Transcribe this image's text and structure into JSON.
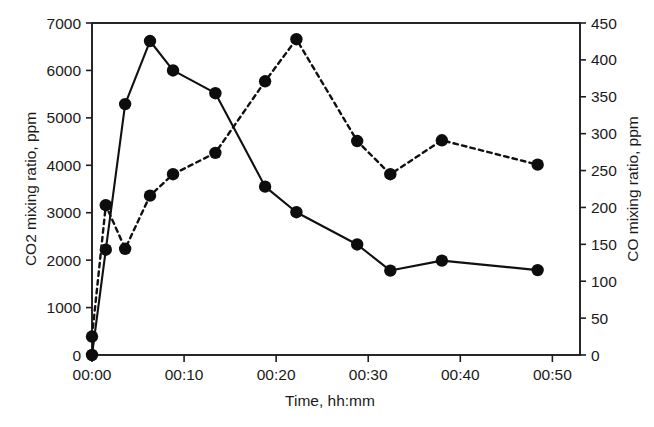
{
  "chart_data": {
    "type": "line",
    "title": "",
    "xlabel": "Time, hh:mm",
    "ylabel": "CO2 mixing ratio, ppm",
    "y2label": "CO mixing ratio, ppm",
    "grid": false,
    "legend": "none",
    "xlim": [
      0,
      53
    ],
    "xticks": [
      0,
      10,
      20,
      30,
      40,
      50
    ],
    "xticklabels": [
      "00:00",
      "00:10",
      "00:20",
      "00:30",
      "00:40",
      "00:50"
    ],
    "ylim": [
      0,
      7000
    ],
    "yticks": [
      0,
      1000,
      2000,
      3000,
      4000,
      5000,
      6000,
      7000
    ],
    "yticklabels": [
      "0",
      "1000",
      "2000",
      "3000",
      "4000",
      "5000",
      "6000",
      "7000"
    ],
    "y2lim": [
      0,
      450
    ],
    "y2ticks": [
      0,
      50,
      100,
      150,
      200,
      250,
      300,
      350,
      400,
      450
    ],
    "y2ticklabels": [
      "0",
      "50",
      "100",
      "150",
      "200",
      "250",
      "300",
      "350",
      "400",
      "450"
    ],
    "series": [
      {
        "name": "CO2 mixing ratio, ppm",
        "axis": "left",
        "style": "solid",
        "marker": "filled-circle",
        "color": "#101010",
        "x": [
          0.0,
          1.5,
          3.6,
          6.3,
          8.8,
          13.4,
          18.8,
          22.2,
          28.8,
          32.4,
          38.0,
          48.4
        ],
        "values": [
          0,
          2220,
          5290,
          6620,
          6000,
          5520,
          3550,
          3010,
          2330,
          1780,
          1990,
          1790
        ]
      },
      {
        "name": "CO mixing ratio, ppm",
        "axis": "right",
        "style": "dashed",
        "marker": "filled-circle",
        "color": "#101010",
        "x": [
          0.0,
          1.5,
          3.6,
          6.3,
          8.8,
          13.4,
          18.8,
          22.2,
          28.8,
          32.4,
          38.0,
          48.4
        ],
        "values": [
          25,
          203,
          144,
          216,
          245,
          274,
          371,
          428,
          290,
          245,
          291,
          258
        ]
      }
    ]
  },
  "axes": {
    "left_title": "CO2 mixing ratio, ppm",
    "right_title": "CO mixing ratio, ppm",
    "bottom_title": "Time, hh:mm"
  }
}
